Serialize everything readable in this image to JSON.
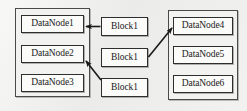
{
  "diagram": {
    "background_color": "#efefed",
    "line_color": "#1a1a1a",
    "box_fill": "#fbfbf9",
    "cluster_fill": "#f2f2f0",
    "clusters": [
      {
        "id": "left",
        "name": "left-datanode-cluster",
        "nodes": [
          {
            "id": "datanode1",
            "label": "DataNode1"
          },
          {
            "id": "datanode2",
            "label": "DataNode2"
          },
          {
            "id": "datanode3",
            "label": "DataNode3"
          }
        ]
      },
      {
        "id": "right",
        "name": "right-datanode-cluster",
        "nodes": [
          {
            "id": "datanode4",
            "label": "DataNode4"
          },
          {
            "id": "datanode5",
            "label": "DataNode5"
          },
          {
            "id": "datanode6",
            "label": "DataNode6"
          }
        ]
      }
    ],
    "blocks": [
      {
        "id": "block-1",
        "label": "Block1"
      },
      {
        "id": "block-2",
        "label": "Block1"
      },
      {
        "id": "block-3",
        "label": "Block1"
      }
    ],
    "connections": [
      {
        "id": "conn-1",
        "from": "block-1",
        "to": "datanode1",
        "style": "arrow"
      },
      {
        "id": "conn-2",
        "from": "block-2",
        "to": "datanode4",
        "style": "arrow"
      },
      {
        "id": "conn-3",
        "from": "block-3",
        "to": "datanode2",
        "style": "arrow"
      }
    ]
  }
}
